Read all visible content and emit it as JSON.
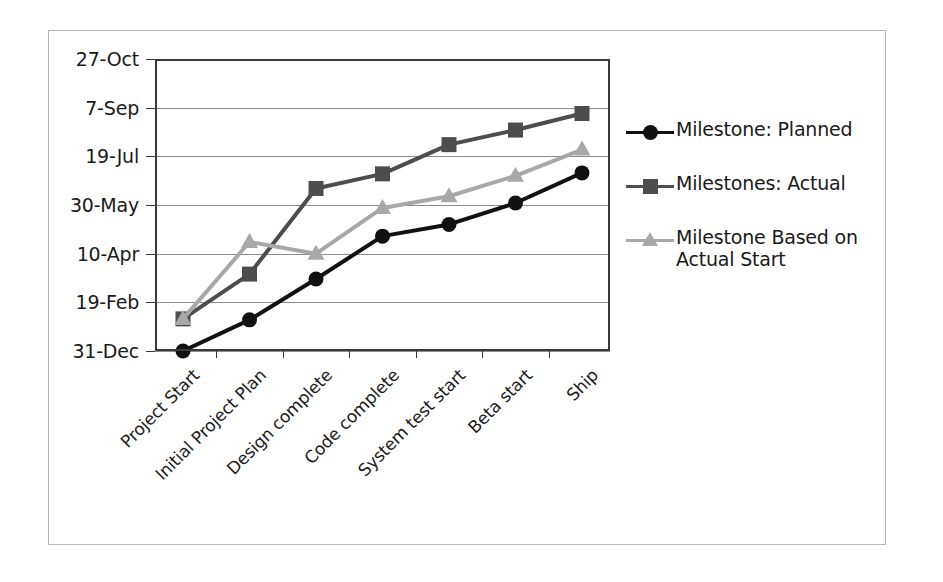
{
  "chart_data": {
    "type": "line",
    "title": "",
    "xlabel": "",
    "ylabel": "",
    "grid": true,
    "legend_position": "right",
    "categories": [
      "Project Start",
      "Initial Project Plan",
      "Design complete",
      "Code complete",
      "System test start",
      "Beta start",
      "Ship"
    ],
    "y_tick_labels": [
      "27-Oct",
      "7-Sep",
      "19-Jul",
      "30-May",
      "10-Apr",
      "19-Feb",
      "31-Dec"
    ],
    "y_tick_values": [
      300,
      250,
      200,
      150,
      100,
      50,
      0
    ],
    "ylim": [
      0,
      300
    ],
    "series": [
      {
        "name": "Milestone: Planned",
        "marker": "circle",
        "color": "#111111",
        "values": [
          0,
          32,
          74,
          118,
          130,
          152,
          183
        ],
        "value_labels": [
          "31-Dec",
          "10-Feb",
          "15-Mar",
          "28-Apr",
          "10-May",
          "1-Jun",
          "2-Jul"
        ]
      },
      {
        "name": "Milestones: Actual",
        "marker": "square",
        "color": "#4d4d4d",
        "values": [
          33,
          79,
          167,
          182,
          212,
          227,
          244
        ],
        "value_labels": [
          "2-Feb",
          "20-Mar",
          "25-Jun",
          "10-Jul",
          "9-Aug",
          "24-Aug",
          "10-Sep"
        ]
      },
      {
        "name": "Milestone Based on Actual Start",
        "marker": "triangle",
        "color": "#a8a8a8",
        "values": [
          33,
          112,
          100,
          147,
          159,
          180,
          207
        ],
        "value_labels": [
          "2-Feb",
          "22-Apr",
          "10-Apr",
          "27-May",
          "8-Jun",
          "29-Jun",
          "26-Jul"
        ]
      }
    ]
  },
  "legend": {
    "items": [
      {
        "label": "Milestone: Planned",
        "marker": "circle-marker",
        "color": "#111111"
      },
      {
        "label": "Milestones: Actual",
        "marker": "square-marker",
        "color": "#4d4d4d"
      },
      {
        "label": "Milestone Based on Actual Start",
        "marker": "triangle-marker",
        "color": "#a8a8a8"
      }
    ]
  }
}
